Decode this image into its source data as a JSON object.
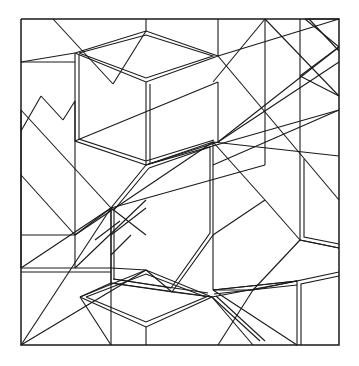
{
  "figure": {
    "title": "Geometric Line Drawing",
    "type": "line-art-diagram",
    "canvas": {
      "width": 359,
      "height": 366
    },
    "colors": {
      "background": "#ffffff",
      "stroke": "#1a1a1a"
    },
    "stroke_widths": {
      "border": 1.5,
      "thin": 1.1,
      "double": 1.1
    },
    "border": {
      "name": "outer-square-frame",
      "points": "21,19 339,19 339,345 21,345 21,19"
    },
    "double_shapes": [
      {
        "name": "cube-top-face",
        "outer": "75,53 146,31 218,56 146,82 75,53",
        "inner": "79,53 146,35 213,56 146,78 79,53"
      },
      {
        "name": "cube-left-edge",
        "outer": "75,53 75,141 146,165",
        "inner": "79,55 79,139 146,161"
      },
      {
        "name": "cube-vertical-center-edge",
        "outer": "146,82 146,165",
        "inner": "150,84 150,163"
      },
      {
        "name": "cube-lower-right-edge",
        "outer": "146,165 218,142",
        "inner": "146,161 214,140"
      },
      {
        "name": "hexagon-center",
        "outer": "146,165 213,142 213,235 172,292 111,283 111,208 146,165",
        "inner": "149,168 210,147 210,233 171,288 114,279 114,210 149,168"
      },
      {
        "name": "rhombus-lower",
        "outer": "80,297 146,270 212,297 146,327 80,297",
        "inner": "86,297 146,274 206,297 146,322 86,297"
      },
      {
        "name": "right-panel-upper",
        "outer": "300,156 300,240 339,248",
        "inner": "304,159 304,237 339,244"
      },
      {
        "name": "right-panel-lower",
        "outer": "297,345 297,281 339,272",
        "inner": "301,345 301,284 339,276"
      },
      {
        "name": "top-right-notch",
        "outer": "305,19 339,47",
        "inner": "309,19 339,51"
      },
      {
        "name": "left-panel-edge",
        "outer": "21,268 111,268",
        "inner": "21,272 111,272"
      },
      {
        "name": "pentagon-lower-right-edge",
        "outer": "212,297 260,341",
        "inner": "216,296 265,341"
      },
      {
        "name": "diagonal-double-center",
        "outer": "111,283 212,297",
        "inner": "113,279 208,293"
      },
      {
        "name": "right-slant-double",
        "outer": "213,290 297,281",
        "inner": "214,294 297,285"
      }
    ],
    "single_lines": [
      {
        "name": "line-tl-diagonal",
        "points": "53,19 113,84"
      },
      {
        "name": "line-left-horizontal-1",
        "points": "21,62 75,62"
      },
      {
        "name": "line-left-vertical-1",
        "points": "21,110 21,268"
      },
      {
        "name": "line-left-zig-a",
        "points": "21,131 41,96"
      },
      {
        "name": "line-left-zig-b",
        "points": "41,96 63,120"
      },
      {
        "name": "line-left-zig-c",
        "points": "63,120 75,101"
      },
      {
        "name": "line-left-long-diag",
        "points": "21,110 111,208"
      },
      {
        "name": "line-left-diag-2",
        "points": "21,175 75,235"
      },
      {
        "name": "line-left-fan-1",
        "points": "21,268 111,208"
      },
      {
        "name": "line-left-fan-2",
        "points": "21,345 111,208"
      },
      {
        "name": "line-left-fan-3",
        "points": "21,345 146,270"
      },
      {
        "name": "line-inner-vert-left",
        "points": "75,141 75,268"
      },
      {
        "name": "line-inner-vert-mid",
        "points": "111,208 111,345"
      },
      {
        "name": "line-vert-top-1",
        "points": "146,19 146,31"
      },
      {
        "name": "line-vert-top-2",
        "points": "218,19 218,56"
      },
      {
        "name": "line-vert-right-1",
        "points": "218,82 218,142"
      },
      {
        "name": "line-vert-right-2",
        "points": "265,19 265,165"
      },
      {
        "name": "line-vert-right-3",
        "points": "300,19 300,156"
      },
      {
        "name": "line-cross-a",
        "points": "218,56 339,19"
      },
      {
        "name": "line-cross-b",
        "points": "265,19 339,96"
      },
      {
        "name": "line-cross-c",
        "points": "339,62 218,142"
      },
      {
        "name": "line-cross-d",
        "points": "339,110 213,165"
      },
      {
        "name": "line-cross-e",
        "points": "218,56 339,200"
      },
      {
        "name": "line-cross-f",
        "points": "339,47 218,142"
      },
      {
        "name": "line-cross-g",
        "points": "265,19 213,82"
      },
      {
        "name": "line-cross-h",
        "points": "213,142 339,156"
      },
      {
        "name": "line-cross-i",
        "points": "146,165 339,110"
      },
      {
        "name": "line-cross-j",
        "points": "111,208 265,165"
      },
      {
        "name": "line-cross-k",
        "points": "75,235 213,142"
      },
      {
        "name": "line-cross-l",
        "points": "75,141 218,82"
      },
      {
        "name": "line-mid-x-a",
        "points": "75,268 146,200"
      },
      {
        "name": "line-mid-x-b",
        "points": "111,208 146,235"
      },
      {
        "name": "line-mid-x-c",
        "points": "111,235 146,208"
      },
      {
        "name": "line-mid-zig",
        "points": "95,240 120,221"
      },
      {
        "name": "line-mid-zig-2",
        "points": "111,255 131,235"
      },
      {
        "name": "line-pent-1",
        "points": "213,235 265,200"
      },
      {
        "name": "line-pent-2",
        "points": "265,200 300,240"
      },
      {
        "name": "line-pent-3",
        "points": "300,240 253,290"
      },
      {
        "name": "line-pent-4",
        "points": "253,290 213,290"
      },
      {
        "name": "line-pent-5",
        "points": "213,290 213,235"
      },
      {
        "name": "line-pent-tail",
        "points": "213,142 265,200"
      },
      {
        "name": "line-right-fan-1",
        "points": "300,240 339,248"
      },
      {
        "name": "line-right-fan-2",
        "points": "253,290 297,281"
      },
      {
        "name": "line-right-fan-3",
        "points": "213,290 297,281"
      },
      {
        "name": "line-bot-1",
        "points": "146,327 146,345"
      },
      {
        "name": "line-bot-2",
        "points": "212,297 253,345"
      },
      {
        "name": "line-bot-3",
        "points": "253,290 218,345"
      },
      {
        "name": "line-bot-4",
        "points": "172,292 212,297"
      },
      {
        "name": "line-bot-5",
        "points": "111,283 80,297"
      },
      {
        "name": "line-bot-6",
        "points": "80,297 111,345"
      },
      {
        "name": "line-bot-7",
        "points": "146,270 172,292"
      },
      {
        "name": "line-bot-8",
        "points": "212,297 297,281"
      },
      {
        "name": "line-bot-9",
        "points": "213,290 297,345"
      },
      {
        "name": "line-bot-10",
        "points": "111,268 146,270"
      },
      {
        "name": "line-upper-mid-1",
        "points": "75,53 21,62"
      },
      {
        "name": "line-upper-mid-2",
        "points": "75,101 75,141"
      },
      {
        "name": "line-upper-mid-3",
        "points": "113,84 146,31"
      },
      {
        "name": "line-upper-mid-4",
        "points": "75,235 111,208"
      },
      {
        "name": "line-upper-mid-5",
        "points": "21,235 75,235"
      },
      {
        "name": "line-top-notch-1",
        "points": "305,19 339,19"
      },
      {
        "name": "line-top-notch-2",
        "points": "339,47 300,76"
      },
      {
        "name": "line-top-notch-3",
        "points": "300,76 339,96"
      }
    ]
  }
}
